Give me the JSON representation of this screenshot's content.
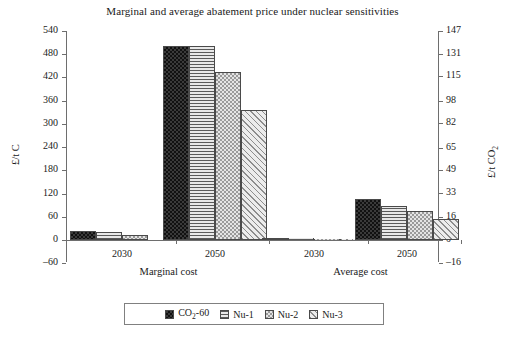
{
  "chart_data": {
    "type": "bar",
    "title": "Marginal and average abatement price under nuclear sensitivities",
    "xlabel": "",
    "ylabel": "£/t C",
    "ylabel_secondary": "£/t CO₂",
    "ylim": [
      -60,
      540
    ],
    "ylim_secondary": [
      -16,
      147
    ],
    "grid": false,
    "legend_position": "bottom",
    "categories": [
      "2030",
      "2050",
      "2030",
      "2050"
    ],
    "groups": [
      {
        "label": "Marginal cost",
        "years": [
          "2030",
          "2050"
        ]
      },
      {
        "label": "Average cost",
        "years": [
          "2030",
          "2050"
        ]
      }
    ],
    "series": [
      {
        "name": "CO2-60",
        "name_display": "CO₂-60",
        "pattern": "dark-checker",
        "values": [
          22,
          500,
          6,
          105
        ]
      },
      {
        "name": "Nu-1",
        "name_display": "Nu-1",
        "pattern": "horizontal-lines",
        "values": [
          20,
          500,
          4,
          88
        ]
      },
      {
        "name": "Nu-2",
        "name_display": "Nu-2",
        "pattern": "light-checker",
        "values": [
          14,
          435,
          3,
          75
        ]
      },
      {
        "name": "Nu-3",
        "name_display": "Nu-3",
        "pattern": "diagonal-hatch",
        "values": [
          0,
          335,
          2,
          55
        ]
      }
    ],
    "yticks": [
      540,
      480,
      420,
      360,
      300,
      240,
      180,
      120,
      60,
      0,
      -60
    ],
    "ytick_labels": [
      "540",
      "480",
      "420",
      "360",
      "300",
      "240",
      "180",
      "120",
      "60",
      "0",
      "–60"
    ],
    "yticks_secondary": [
      147,
      131,
      115,
      98,
      82,
      65,
      49,
      33,
      16,
      0,
      -16
    ],
    "ytick_labels_secondary": [
      "147",
      "131",
      "115",
      "98",
      "82",
      "65",
      "49",
      "33",
      "16",
      "0",
      "–16"
    ]
  },
  "legend": {
    "items": [
      {
        "label": "CO₂-60",
        "pattern": "dark-checker"
      },
      {
        "label": "Nu-1",
        "pattern": "horizontal-lines"
      },
      {
        "label": "Nu-2",
        "pattern": "light-checker"
      },
      {
        "label": "Nu-3",
        "pattern": "diagonal-hatch"
      }
    ]
  }
}
